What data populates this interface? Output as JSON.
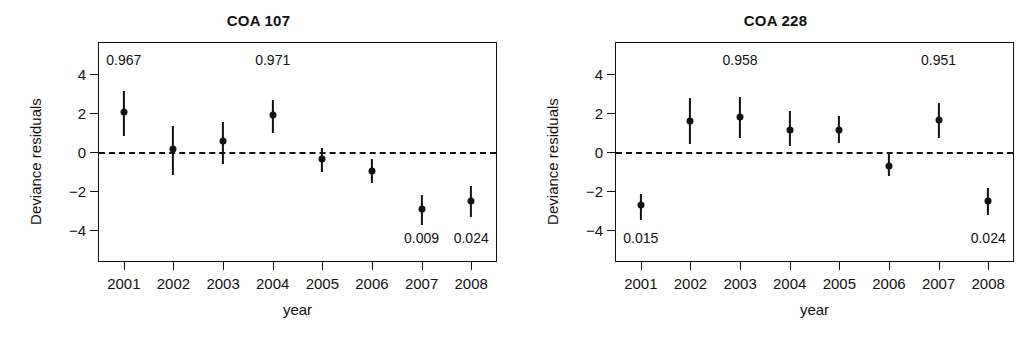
{
  "figure": {
    "width": 1034,
    "height": 342,
    "background": "#ffffff",
    "ink_color": "#111111"
  },
  "chart_data": [
    {
      "type": "scatter",
      "title": "COA 107",
      "xlabel": "year",
      "ylabel": "Deviance residuals",
      "x": [
        "2001",
        "2002",
        "2003",
        "2004",
        "2005",
        "2006",
        "2007",
        "2008"
      ],
      "categories": [
        "2001",
        "2002",
        "2003",
        "2004",
        "2005",
        "2006",
        "2007",
        "2008"
      ],
      "values": [
        2.05,
        0.15,
        0.55,
        1.9,
        -0.35,
        -1.0,
        -2.95,
        -2.5
      ],
      "error_low": [
        0.8,
        -1.2,
        -0.6,
        0.95,
        -1.05,
        -1.6,
        -3.75,
        -3.35
      ],
      "error_high": [
        3.15,
        1.35,
        1.55,
        2.65,
        0.2,
        -0.35,
        -2.2,
        -1.75
      ],
      "yticks": [
        4,
        2,
        0,
        -2,
        -4
      ],
      "ytick_labels": [
        "4",
        "2",
        "0",
        "−2",
        "−4"
      ],
      "ylim": [
        -5.6,
        5.6
      ],
      "grid": false,
      "legend": "none",
      "reference_line": {
        "y": 0,
        "style": "dashed"
      },
      "annotations": [
        {
          "text": "0.967",
          "x": "2001",
          "position": "top"
        },
        {
          "text": "0.971",
          "x": "2004",
          "position": "top"
        },
        {
          "text": "0.009",
          "x": "2007",
          "position": "bottom"
        },
        {
          "text": "0.024",
          "x": "2008",
          "position": "bottom"
        }
      ]
    },
    {
      "type": "scatter",
      "title": "COA 228",
      "xlabel": "year",
      "ylabel": "Deviance residuals",
      "x": [
        "2001",
        "2002",
        "2003",
        "2004",
        "2005",
        "2006",
        "2007",
        "2008"
      ],
      "categories": [
        "2001",
        "2002",
        "2003",
        "2004",
        "2005",
        "2006",
        "2007",
        "2008"
      ],
      "values": [
        -2.7,
        1.6,
        1.8,
        1.15,
        1.15,
        -0.7,
        1.65,
        -2.5
      ],
      "error_low": [
        -3.5,
        0.4,
        0.7,
        0.3,
        0.45,
        -1.25,
        0.7,
        -3.25
      ],
      "error_high": [
        -2.15,
        2.75,
        2.85,
        2.1,
        1.85,
        -0.02,
        2.5,
        -1.85
      ],
      "yticks": [
        4,
        2,
        0,
        -2,
        -4
      ],
      "ytick_labels": [
        "4",
        "2",
        "0",
        "−2",
        "−4"
      ],
      "ylim": [
        -5.6,
        5.6
      ],
      "grid": false,
      "legend": "none",
      "reference_line": {
        "y": 0,
        "style": "dashed"
      },
      "annotations": [
        {
          "text": "0.958",
          "x": "2003",
          "position": "top"
        },
        {
          "text": "0.951",
          "x": "2007",
          "position": "top"
        },
        {
          "text": "0.015",
          "x": "2001",
          "position": "bottom"
        },
        {
          "text": "0.024",
          "x": "2008",
          "position": "bottom"
        }
      ]
    }
  ]
}
